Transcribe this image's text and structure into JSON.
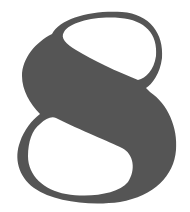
{
  "figure": {
    "glyph": "8",
    "colors": {
      "fill": "#555555",
      "background": "#ffffff"
    }
  }
}
